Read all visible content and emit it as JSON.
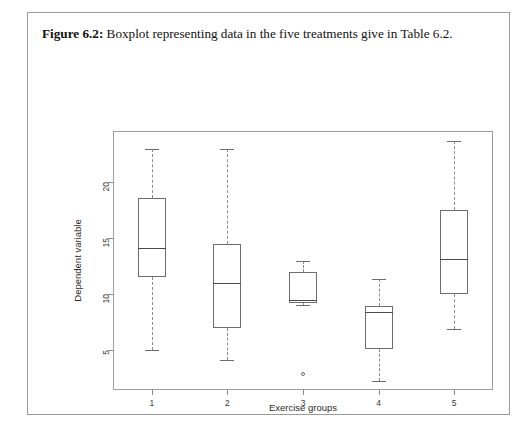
{
  "figure": {
    "caption_label": "Figure 6.2:",
    "caption_text": "Boxplot representing data in the five treatments give in Table 6.2."
  },
  "chart_data": {
    "type": "box",
    "title": "",
    "xlabel": "Exercise groups",
    "ylabel": "Dependent variable",
    "categories": [
      "1",
      "2",
      "3",
      "4",
      "5"
    ],
    "ytick_labels": [
      "5",
      "10",
      "15",
      "20"
    ],
    "yticks": [
      5,
      10,
      15,
      20
    ],
    "ylim": [
      1.5,
      24.5
    ],
    "grid": false,
    "legend": null,
    "boxes": [
      {
        "group": "1",
        "whisker_low": 5.0,
        "q1": 11.5,
        "median": 14.1,
        "q3": 18.6,
        "whisker_high": 23.0,
        "outliers": []
      },
      {
        "group": "2",
        "whisker_low": 4.1,
        "q1": 7.0,
        "median": 11.0,
        "q3": 14.5,
        "whisker_high": 23.0,
        "outliers": []
      },
      {
        "group": "3",
        "whisker_low": 9.0,
        "q1": 9.2,
        "median": 9.5,
        "q3": 12.0,
        "whisker_high": 13.0,
        "outliers": [
          2.8
        ]
      },
      {
        "group": "4",
        "whisker_low": 2.2,
        "q1": 5.1,
        "median": 8.4,
        "q3": 8.9,
        "whisker_high": 11.3,
        "outliers": []
      },
      {
        "group": "5",
        "whisker_low": 6.9,
        "q1": 10.0,
        "median": 13.1,
        "q3": 17.5,
        "whisker_high": 23.7,
        "outliers": []
      }
    ]
  }
}
